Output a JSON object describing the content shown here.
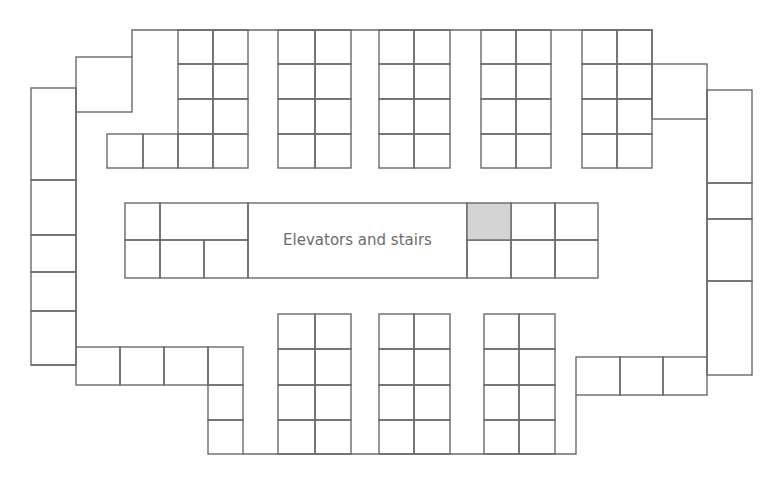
{
  "diagram": {
    "type": "floor-plan",
    "stroke_color": "#6a6a6a",
    "highlight_color": "#d4d4d4",
    "core": {
      "label": "Elevators and stairs",
      "rect": [
        248,
        203,
        219,
        75
      ]
    },
    "highlighted_space": {
      "rect": [
        467,
        203,
        44,
        37
      ]
    },
    "spaces": [
      [
        31,
        88,
        45,
        92
      ],
      [
        31,
        180,
        45,
        55
      ],
      [
        31,
        235,
        45,
        37
      ],
      [
        31,
        272,
        45,
        39
      ],
      [
        31,
        311,
        45,
        54
      ],
      [
        76,
        57,
        56,
        55
      ],
      [
        107,
        134,
        36,
        34
      ],
      [
        143,
        134,
        35,
        34
      ],
      [
        178,
        30,
        35,
        34
      ],
      [
        213,
        30,
        35,
        34
      ],
      [
        178,
        64,
        35,
        35
      ],
      [
        213,
        64,
        35,
        35
      ],
      [
        178,
        99,
        35,
        35
      ],
      [
        213,
        99,
        35,
        35
      ],
      [
        178,
        134,
        35,
        34
      ],
      [
        213,
        134,
        35,
        34
      ],
      [
        278,
        30,
        37,
        34
      ],
      [
        315,
        30,
        36,
        34
      ],
      [
        278,
        64,
        37,
        35
      ],
      [
        315,
        64,
        36,
        35
      ],
      [
        278,
        99,
        37,
        35
      ],
      [
        315,
        99,
        36,
        35
      ],
      [
        278,
        134,
        37,
        34
      ],
      [
        315,
        134,
        36,
        34
      ],
      [
        379,
        30,
        35,
        34
      ],
      [
        414,
        30,
        36,
        34
      ],
      [
        379,
        64,
        35,
        35
      ],
      [
        414,
        64,
        36,
        35
      ],
      [
        379,
        99,
        35,
        35
      ],
      [
        414,
        99,
        36,
        35
      ],
      [
        379,
        134,
        35,
        34
      ],
      [
        414,
        134,
        36,
        34
      ],
      [
        481,
        30,
        35,
        34
      ],
      [
        516,
        30,
        35,
        34
      ],
      [
        481,
        64,
        35,
        35
      ],
      [
        516,
        64,
        35,
        35
      ],
      [
        481,
        99,
        35,
        35
      ],
      [
        516,
        99,
        35,
        35
      ],
      [
        481,
        134,
        35,
        34
      ],
      [
        516,
        134,
        35,
        34
      ],
      [
        582,
        30,
        35,
        34
      ],
      [
        617,
        30,
        35,
        34
      ],
      [
        582,
        64,
        35,
        35
      ],
      [
        617,
        64,
        35,
        35
      ],
      [
        582,
        99,
        35,
        35
      ],
      [
        617,
        99,
        35,
        35
      ],
      [
        582,
        134,
        35,
        34
      ],
      [
        617,
        134,
        35,
        34
      ],
      [
        652,
        64,
        55,
        55
      ],
      [
        707,
        90,
        45,
        93
      ],
      [
        707,
        183,
        45,
        36
      ],
      [
        707,
        219,
        45,
        62
      ],
      [
        707,
        281,
        45,
        94
      ],
      [
        125,
        203,
        35,
        37
      ],
      [
        160,
        203,
        88,
        37
      ],
      [
        125,
        240,
        35,
        38
      ],
      [
        160,
        240,
        44,
        38
      ],
      [
        204,
        240,
        44,
        38
      ],
      [
        511,
        203,
        44,
        37
      ],
      [
        555,
        203,
        43,
        37
      ],
      [
        467,
        240,
        44,
        38
      ],
      [
        511,
        240,
        44,
        38
      ],
      [
        555,
        240,
        43,
        38
      ],
      [
        76,
        347,
        44,
        38
      ],
      [
        120,
        347,
        44,
        38
      ],
      [
        164,
        347,
        44,
        38
      ],
      [
        208,
        347,
        35,
        38
      ],
      [
        208,
        385,
        35,
        35
      ],
      [
        208,
        420,
        35,
        34
      ],
      [
        278,
        314,
        37,
        35
      ],
      [
        315,
        314,
        36,
        35
      ],
      [
        278,
        349,
        37,
        36
      ],
      [
        315,
        349,
        36,
        36
      ],
      [
        278,
        385,
        37,
        35
      ],
      [
        315,
        385,
        36,
        35
      ],
      [
        278,
        420,
        37,
        34
      ],
      [
        315,
        420,
        36,
        34
      ],
      [
        379,
        314,
        35,
        35
      ],
      [
        414,
        314,
        36,
        35
      ],
      [
        379,
        349,
        35,
        36
      ],
      [
        414,
        349,
        36,
        36
      ],
      [
        379,
        385,
        35,
        35
      ],
      [
        414,
        385,
        36,
        35
      ],
      [
        379,
        420,
        35,
        34
      ],
      [
        414,
        420,
        36,
        34
      ],
      [
        484,
        314,
        35,
        35
      ],
      [
        519,
        314,
        36,
        35
      ],
      [
        484,
        349,
        35,
        36
      ],
      [
        519,
        349,
        36,
        36
      ],
      [
        484,
        385,
        35,
        35
      ],
      [
        519,
        385,
        36,
        35
      ],
      [
        484,
        420,
        35,
        34
      ],
      [
        519,
        420,
        36,
        34
      ],
      [
        576,
        357,
        44,
        38
      ],
      [
        620,
        357,
        43,
        38
      ],
      [
        663,
        357,
        44,
        38
      ]
    ],
    "walls": [
      "M76 112 L76 347",
      "M132 57 L132 30 L652 30 L652 64",
      "M707 90 L707 357",
      "M576 395 L576 454 L243 454",
      "M31 365 L76 365"
    ]
  }
}
